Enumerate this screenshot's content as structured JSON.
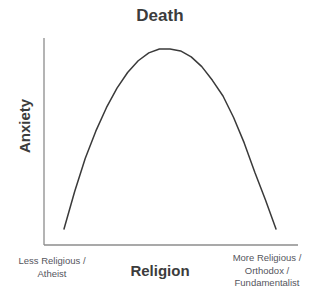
{
  "figure": {
    "background_color": "#ffffff",
    "title": "Death",
    "title_color": "#3c3c3c",
    "axis_color": "#8c8c8c",
    "curve_color": "#3a3a3a",
    "label_color": "#55555d"
  },
  "axes": {
    "y_label": "Anxiety",
    "x_label": "Religion",
    "x_start_label": "Less Religious /\nAtheist",
    "x_end_label": "More Religious /\nOrthodox /\nFundamentalist",
    "ticks": false,
    "grid": false
  },
  "chart_data": {
    "type": "line",
    "title": "Death",
    "xlabel": "Religion",
    "ylabel": "Anxiety",
    "grid": false,
    "legend": false,
    "xlim": [
      0,
      1
    ],
    "ylim": [
      0,
      1
    ],
    "xtick_labels": [
      "Less Religious / Atheist",
      "More Religious / Orthodox / Fundamentalist"
    ],
    "ytick_labels": [],
    "annotations": [],
    "series": [
      {
        "name": "Death anxiety",
        "shape": "inverted-parabola",
        "x": [
          0.0,
          0.05,
          0.1,
          0.15,
          0.2,
          0.25,
          0.3,
          0.35,
          0.4,
          0.45,
          0.5,
          0.55,
          0.6,
          0.65,
          0.7,
          0.75,
          0.8,
          0.85,
          0.9,
          0.95,
          1.0
        ],
        "y": [
          0.08,
          0.27,
          0.44,
          0.58,
          0.7,
          0.8,
          0.88,
          0.94,
          0.98,
          1.0,
          1.0,
          0.99,
          0.96,
          0.91,
          0.84,
          0.76,
          0.65,
          0.52,
          0.37,
          0.23,
          0.08
        ],
        "peak": {
          "x": 0.48,
          "y": 1.0
        }
      }
    ]
  },
  "geometry": {
    "y_axis_x": 44,
    "y_axis_top": 38,
    "axis_baseline_y": 245,
    "x_axis_right": 298,
    "curve_left_x": 64,
    "curve_right_x": 276,
    "curve_bottom_y": 229,
    "curve_peak_x": 172,
    "curve_peak_y": 49
  }
}
